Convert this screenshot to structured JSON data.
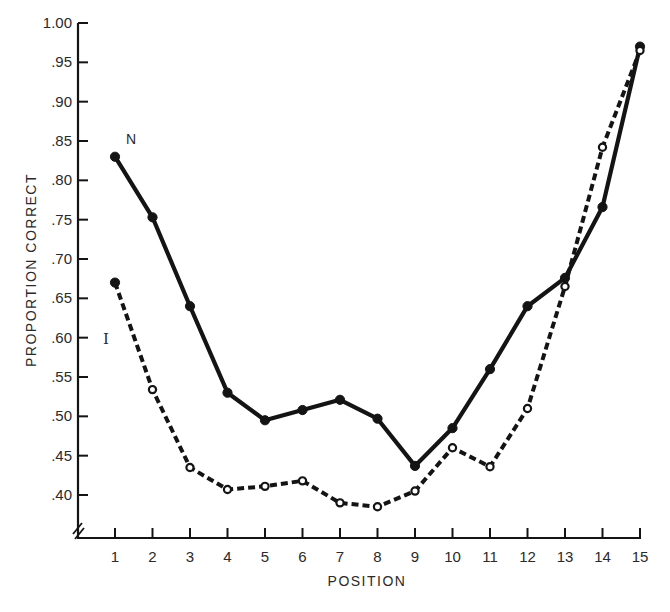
{
  "chart_data": {
    "type": "line",
    "title": "",
    "xlabel": "POSITION",
    "ylabel": "PROPORTION CORRECT",
    "x": [
      1,
      2,
      3,
      4,
      5,
      6,
      7,
      8,
      9,
      10,
      11,
      12,
      13,
      14,
      15
    ],
    "x_tick_labels": [
      "1",
      "2",
      "3",
      "4",
      "5",
      "6",
      "7",
      "8",
      "9",
      "10",
      "11",
      "12",
      "13",
      "14",
      "15"
    ],
    "y_tick_values": [
      0.4,
      0.45,
      0.5,
      0.55,
      0.6,
      0.65,
      0.7,
      0.75,
      0.8,
      0.85,
      0.9,
      0.95,
      1.0
    ],
    "y_tick_labels": [
      ".40",
      ".45",
      ".50",
      ".55",
      ".60",
      ".65",
      ".70",
      ".75",
      ".80",
      ".85",
      ".90",
      ".95",
      "1.00"
    ],
    "ylim": [
      0.4,
      1.0
    ],
    "xlim": [
      1,
      15
    ],
    "y_axis_break": true,
    "grid": false,
    "legend": "inline labels at left of series",
    "series": [
      {
        "name": "N",
        "line_style": "solid",
        "marker": "filled-circle",
        "values": [
          0.83,
          0.753,
          0.64,
          0.53,
          0.495,
          0.508,
          0.521,
          0.497,
          0.437,
          0.485,
          0.56,
          0.64,
          0.676,
          0.766,
          0.97
        ]
      },
      {
        "name": "I",
        "line_style": "dashed",
        "marker": "open-circle",
        "values": [
          0.67,
          0.534,
          0.435,
          0.407,
          0.411,
          0.418,
          0.39,
          0.385,
          0.405,
          0.46,
          0.436,
          0.51,
          0.665,
          0.842,
          0.965
        ]
      }
    ]
  },
  "labels": {
    "series_n": "N",
    "series_i": "I",
    "xlabel": "POSITION",
    "ylabel": "PROPORTION CORRECT"
  },
  "colors": {
    "ink": "#141414",
    "text": "#2a2a2a",
    "background": "#ffffff"
  }
}
